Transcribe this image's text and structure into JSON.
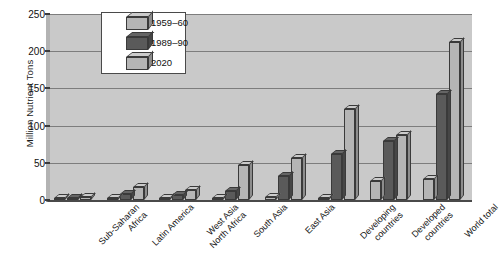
{
  "chart_data": {
    "type": "bar",
    "title": "",
    "xlabel": "",
    "ylabel": "Million Nutrient Tons",
    "ylim": [
      0,
      250
    ],
    "yticks": [
      0,
      50,
      100,
      150,
      200,
      250
    ],
    "grid": true,
    "legend_position": "top-left-inside",
    "style": "3d-bars",
    "categories": [
      "Sub-Saharan\nAfrica",
      "Latin America",
      "West Asia\nNorth Africa",
      "South Asia",
      "East Asia",
      "Developing\ncountries",
      "Developed\ncountries",
      "World total"
    ],
    "series": [
      {
        "name": "1959–60",
        "color": "#b5b5b5",
        "values": [
          1,
          3,
          2,
          3,
          4,
          3,
          25,
          28
        ]
      },
      {
        "name": "1989–90",
        "color": "#5a5a5a",
        "values": [
          2,
          8,
          7,
          12,
          32,
          62,
          79,
          143
        ]
      },
      {
        "name": "2020",
        "color": "#b5b5b5",
        "values": [
          4,
          18,
          14,
          47,
          56,
          122,
          87,
          212
        ]
      }
    ]
  },
  "axis": {
    "y_title": "Million Nutrient Tons",
    "y_tick_labels": [
      "0",
      "50",
      "100",
      "150",
      "200",
      "250"
    ]
  },
  "legend": {
    "entries": [
      {
        "label": "1959–60"
      },
      {
        "label": "1989–90"
      },
      {
        "label": "2020"
      }
    ]
  }
}
